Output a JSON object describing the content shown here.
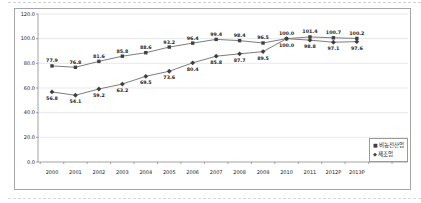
{
  "chart_data": {
    "type": "line",
    "title": "",
    "categories": [
      "2000",
      "2001",
      "2002",
      "2003",
      "2004",
      "2005",
      "2006",
      "2007",
      "2008",
      "2009",
      "2010",
      "2011",
      "2012P",
      "2013P"
    ],
    "series": [
      {
        "name": "비농전산업",
        "marker": "square",
        "label_position": "above",
        "values": [
          77.9,
          76.8,
          81.6,
          85.8,
          88.6,
          93.2,
          96.4,
          99.4,
          98.4,
          96.5,
          100.0,
          101.4,
          100.7,
          100.2
        ]
      },
      {
        "name": "제조업",
        "marker": "diamond",
        "label_position": "below",
        "values": [
          56.8,
          54.1,
          59.2,
          63.2,
          69.5,
          73.6,
          80.4,
          85.8,
          87.7,
          89.5,
          100.0,
          98.8,
          97.1,
          97.6
        ]
      }
    ],
    "xlabel": "",
    "ylabel": "",
    "ylim": [
      0,
      120
    ],
    "ytick_step": 20,
    "ytick_decimals": 1,
    "value_label_decimals": 1,
    "grid": true,
    "legend_position": "bottom-right",
    "value_labels": true
  },
  "icons": {
    "series1_marker": "■",
    "series2_marker": "◆"
  },
  "colors": {
    "line": "#7d7d7d",
    "marker": "#3f3f3f",
    "grid": "#d9d9d9",
    "axis": "#8c8c8c",
    "text": "#1a1a1a",
    "frame_border": "#a6a6a6",
    "background": "#ffffff"
  }
}
